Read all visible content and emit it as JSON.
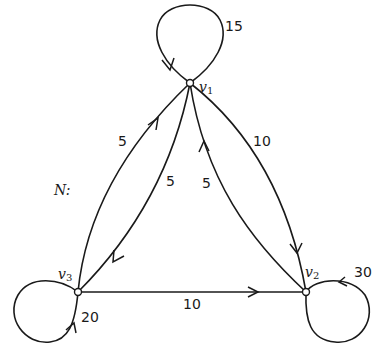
{
  "network": {
    "name": "N:",
    "nodes": [
      {
        "id": "v1",
        "label": "v",
        "sub": "1"
      },
      {
        "id": "v2",
        "label": "v",
        "sub": "2"
      },
      {
        "id": "v3",
        "label": "v",
        "sub": "3"
      }
    ],
    "edges": [
      {
        "from": "v1",
        "to": "v1",
        "weight": "15"
      },
      {
        "from": "v2",
        "to": "v2",
        "weight": "30"
      },
      {
        "from": "v3",
        "to": "v3",
        "weight": "20"
      },
      {
        "from": "v3",
        "to": "v1",
        "weight": "5"
      },
      {
        "from": "v1",
        "to": "v3",
        "weight": "5"
      },
      {
        "from": "v1",
        "to": "v2",
        "weight": "10"
      },
      {
        "from": "v2",
        "to": "v1",
        "weight": "5"
      },
      {
        "from": "v3",
        "to": "v2",
        "weight": "10"
      }
    ]
  }
}
